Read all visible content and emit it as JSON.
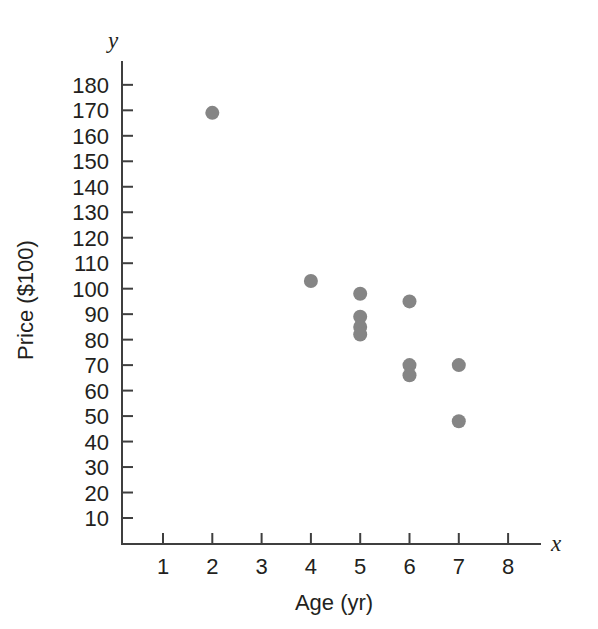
{
  "chart_data": {
    "type": "scatter",
    "title": "",
    "xlabel": "Age (yr)",
    "ylabel": "Price ($100)",
    "x_axis_name": "x",
    "y_axis_name": "y",
    "xlim": [
      0,
      8.8
    ],
    "ylim": [
      0,
      188
    ],
    "grid": false,
    "legend": "none",
    "x_ticks": [
      1,
      2,
      3,
      4,
      5,
      6,
      7,
      8
    ],
    "x_tick_labels": [
      "1",
      "2",
      "3",
      "4",
      "5",
      "6",
      "7",
      "8"
    ],
    "y_ticks": [
      10,
      20,
      30,
      40,
      50,
      60,
      70,
      80,
      90,
      100,
      110,
      120,
      130,
      140,
      150,
      160,
      170,
      180
    ],
    "y_tick_labels": [
      "10",
      "20",
      "30",
      "40",
      "50",
      "60",
      "70",
      "80",
      "90",
      "100",
      "110",
      "120",
      "130",
      "140",
      "150",
      "160",
      "170",
      "180"
    ],
    "marker": "circle",
    "marker_color": "#858585",
    "marker_radius": 7,
    "points": [
      {
        "x": 2,
        "y": 169
      },
      {
        "x": 4,
        "y": 103
      },
      {
        "x": 5,
        "y": 98
      },
      {
        "x": 5,
        "y": 89
      },
      {
        "x": 5,
        "y": 85
      },
      {
        "x": 5,
        "y": 82
      },
      {
        "x": 6,
        "y": 95
      },
      {
        "x": 6,
        "y": 70
      },
      {
        "x": 6,
        "y": 66
      },
      {
        "x": 7,
        "y": 70
      },
      {
        "x": 7,
        "y": 48
      }
    ],
    "x_values": [
      2,
      4,
      5,
      5,
      5,
      5,
      6,
      6,
      6,
      7,
      7
    ],
    "y_values": [
      169,
      103,
      98,
      89,
      85,
      82,
      95,
      70,
      66,
      70,
      48
    ]
  },
  "colors": {
    "marker": "#858585",
    "axis": "#3f3f3f",
    "text": "#231f20",
    "background": "#ffffff"
  }
}
